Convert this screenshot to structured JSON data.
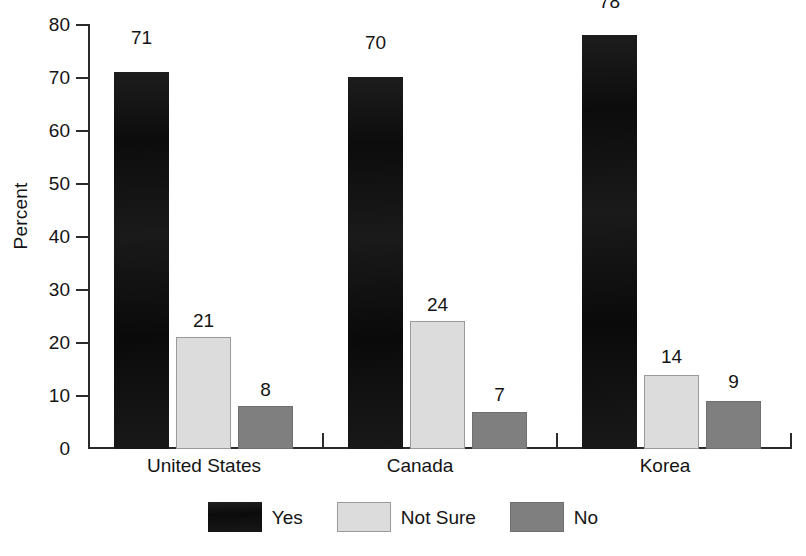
{
  "chart_data": {
    "type": "bar",
    "title": "",
    "subtitle": "",
    "xlabel": "",
    "ylabel": "Percent",
    "ylim": [
      0,
      80
    ],
    "ytick_labels": [
      "0",
      "10",
      "20",
      "30",
      "40",
      "50",
      "60",
      "70",
      "80"
    ],
    "ytick_values": [
      0,
      10,
      20,
      30,
      40,
      50,
      60,
      70,
      80
    ],
    "grid": false,
    "legend_position": "bottom-center",
    "categories": [
      "United States",
      "Canada",
      "Korea"
    ],
    "series": [
      {
        "name": "Yes",
        "color": "#151515",
        "values": [
          71,
          70,
          78
        ]
      },
      {
        "name": "Not Sure",
        "color": "#dcdcdc",
        "values": [
          21,
          24,
          14
        ]
      },
      {
        "name": "No",
        "color": "#7f7f7f",
        "values": [
          8,
          7,
          9
        ]
      }
    ],
    "data_labels": {
      "united_states": {
        "yes": "71",
        "not_sure": "21",
        "no": "8"
      },
      "canada": {
        "yes": "70",
        "not_sure": "24",
        "no": "7"
      },
      "korea": {
        "yes": "78",
        "not_sure": "14",
        "no": "9"
      }
    }
  },
  "axis": {
    "y_title": "Percent",
    "y_ticks": [
      "80",
      "70",
      "60",
      "50",
      "40",
      "30",
      "20",
      "10",
      "0"
    ]
  },
  "categories": {
    "c0": "United States",
    "c1": "Canada",
    "c2": "Korea"
  },
  "legend": {
    "items": [
      {
        "label": "Yes",
        "color": "#151515"
      },
      {
        "label": "Not Sure",
        "color": "#dcdcdc"
      },
      {
        "label": "No",
        "color": "#7f7f7f"
      }
    ]
  },
  "values": {
    "us_yes": "71",
    "us_notsure": "21",
    "us_no": "8",
    "ca_yes": "70",
    "ca_notsure": "24",
    "ca_no": "7",
    "kr_yes": "78",
    "kr_notsure": "14",
    "kr_no": "9"
  }
}
